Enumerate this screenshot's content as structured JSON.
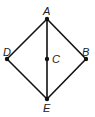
{
  "diagram": {
    "type": "geometry-figure",
    "points": [
      {
        "id": "A",
        "label": "A",
        "x": 47,
        "y": 19
      },
      {
        "id": "B",
        "label": "B",
        "x": 86,
        "y": 59
      },
      {
        "id": "C",
        "label": "C",
        "x": 47,
        "y": 59
      },
      {
        "id": "D",
        "label": "D",
        "x": 7,
        "y": 59
      },
      {
        "id": "E",
        "label": "E",
        "x": 47,
        "y": 99
      }
    ],
    "segments": [
      [
        "A",
        "B"
      ],
      [
        "B",
        "E"
      ],
      [
        "E",
        "D"
      ],
      [
        "D",
        "A"
      ],
      [
        "A",
        "E"
      ]
    ],
    "colors": {
      "line": "#111111",
      "point": "#111111",
      "label": "#222222"
    }
  }
}
